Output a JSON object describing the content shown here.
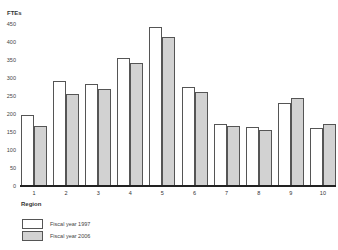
{
  "chart_data": {
    "type": "bar",
    "title": "",
    "ylabel": "FTEs",
    "xlabel": "Region",
    "ylim": [
      0,
      450
    ],
    "yticks": [
      0,
      50,
      100,
      150,
      200,
      250,
      300,
      350,
      400,
      450
    ],
    "categories": [
      "1",
      "2",
      "3",
      "4",
      "5",
      "6",
      "7",
      "8",
      "9",
      "10"
    ],
    "series": [
      {
        "name": "Fiscal year 1997",
        "color": "#ffffff",
        "values": [
          195,
          290,
          283,
          355,
          440,
          274,
          170,
          163,
          230,
          160
        ]
      },
      {
        "name": "Fiscal year 2006",
        "color": "#d2d2d2",
        "values": [
          165,
          255,
          269,
          340,
          412,
          259,
          165,
          155,
          242,
          170
        ]
      }
    ],
    "grid": false,
    "legend_position": "bottom-left"
  },
  "labels": {
    "y_title": "FTEs",
    "x_title": "Region",
    "legend": [
      "Fiscal year 1997",
      "Fiscal year 2006"
    ]
  }
}
